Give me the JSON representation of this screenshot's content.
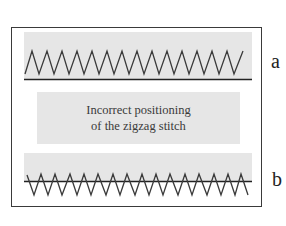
{
  "figure": {
    "caption_lines": [
      "Incorrect positioning",
      "of the zigzag stitch"
    ],
    "panels": [
      {
        "id": "a",
        "label": "a",
        "description": "Zigzag stitch entirely above the fabric edge line"
      },
      {
        "id": "b",
        "label": "b",
        "description": "Zigzag stitch straddling the fabric edge line"
      }
    ],
    "colors": {
      "shade": "#e6e6e6",
      "stitch": "#3a3a3a",
      "frame": "#3a3a3a",
      "edge_line": "#222222"
    }
  }
}
